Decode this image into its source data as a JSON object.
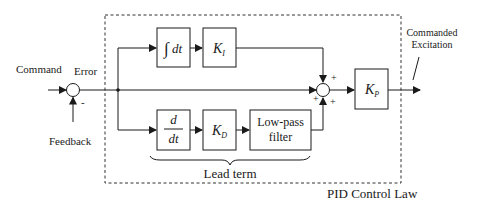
{
  "diagram": {
    "title": "PID Control Law",
    "colors": {
      "ink": "#1a1a1a",
      "background": "#ffffff"
    },
    "inputs": {
      "command": "Command",
      "feedback": "Feedback",
      "error": "Error",
      "feedback_sign": "-"
    },
    "output": {
      "line1": "Commanded",
      "line2": "Excitation"
    },
    "blocks": {
      "integrator": {
        "symbol": "∫",
        "var": "dt"
      },
      "ki": {
        "base": "K",
        "sub": "I"
      },
      "derivative": {
        "num": "d",
        "den": "dt"
      },
      "kd": {
        "base": "K",
        "sub": "D"
      },
      "lowpass": {
        "line1": "Low-pass",
        "line2": "filter"
      },
      "kp": {
        "base": "K",
        "sub": "P"
      }
    },
    "summer": {
      "signs": {
        "top": "+",
        "left": "+",
        "bottom_left": "+",
        "bottom_right": "+"
      }
    },
    "brace_label": "Lead term"
  }
}
